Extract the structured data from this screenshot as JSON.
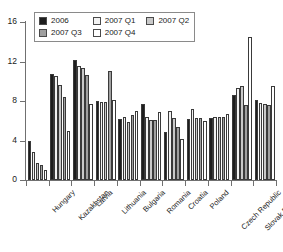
{
  "chart_data": {
    "type": "bar",
    "title": "",
    "subtitle": "",
    "xlabel": "",
    "ylabel": "",
    "ylim": [
      0,
      16
    ],
    "yticks": [
      0,
      4,
      8,
      12,
      16
    ],
    "grid": false,
    "legend_position": "top-left",
    "legend_entries": [
      "2006",
      "2007 Q1",
      "2007 Q2",
      "2007 Q3",
      "2007 Q4"
    ],
    "categories": [
      "Hungary",
      "Kazakhstan",
      "Latvia",
      "Lithuania",
      "Bulgaria",
      "Romania",
      "Croatia",
      "Poland",
      "Czech Republic",
      "Slovak Republic",
      "Russian Federation"
    ],
    "series": [
      {
        "name": "2006",
        "color": "#1e1e1e",
        "values": [
          4.0,
          10.7,
          12.2,
          8.0,
          6.2,
          7.7,
          4.9,
          6.2,
          6.3,
          8.6,
          8.1
        ]
      },
      {
        "name": "2007 Q1",
        "color": "#f2f2f2",
        "values": [
          2.8,
          10.5,
          11.5,
          7.9,
          6.4,
          6.4,
          7.0,
          7.2,
          6.4,
          9.3,
          7.8
        ]
      },
      {
        "name": "2007 Q2",
        "color": "#c9c9c9",
        "values": [
          1.7,
          9.6,
          11.3,
          7.9,
          5.9,
          6.1,
          6.3,
          6.3,
          6.4,
          9.5,
          7.7
        ]
      },
      {
        "name": "2007 Q3",
        "color": "#a0a0a0",
        "values": [
          1.5,
          8.4,
          10.6,
          11.0,
          6.6,
          6.1,
          5.4,
          6.3,
          6.4,
          7.6,
          7.6
        ]
      },
      {
        "name": "2007 Q4",
        "color": "#ffffff",
        "values": [
          1.0,
          5.0,
          7.7,
          8.1,
          7.0,
          6.9,
          4.2,
          6.0,
          6.7,
          14.5,
          9.5
        ]
      }
    ]
  }
}
